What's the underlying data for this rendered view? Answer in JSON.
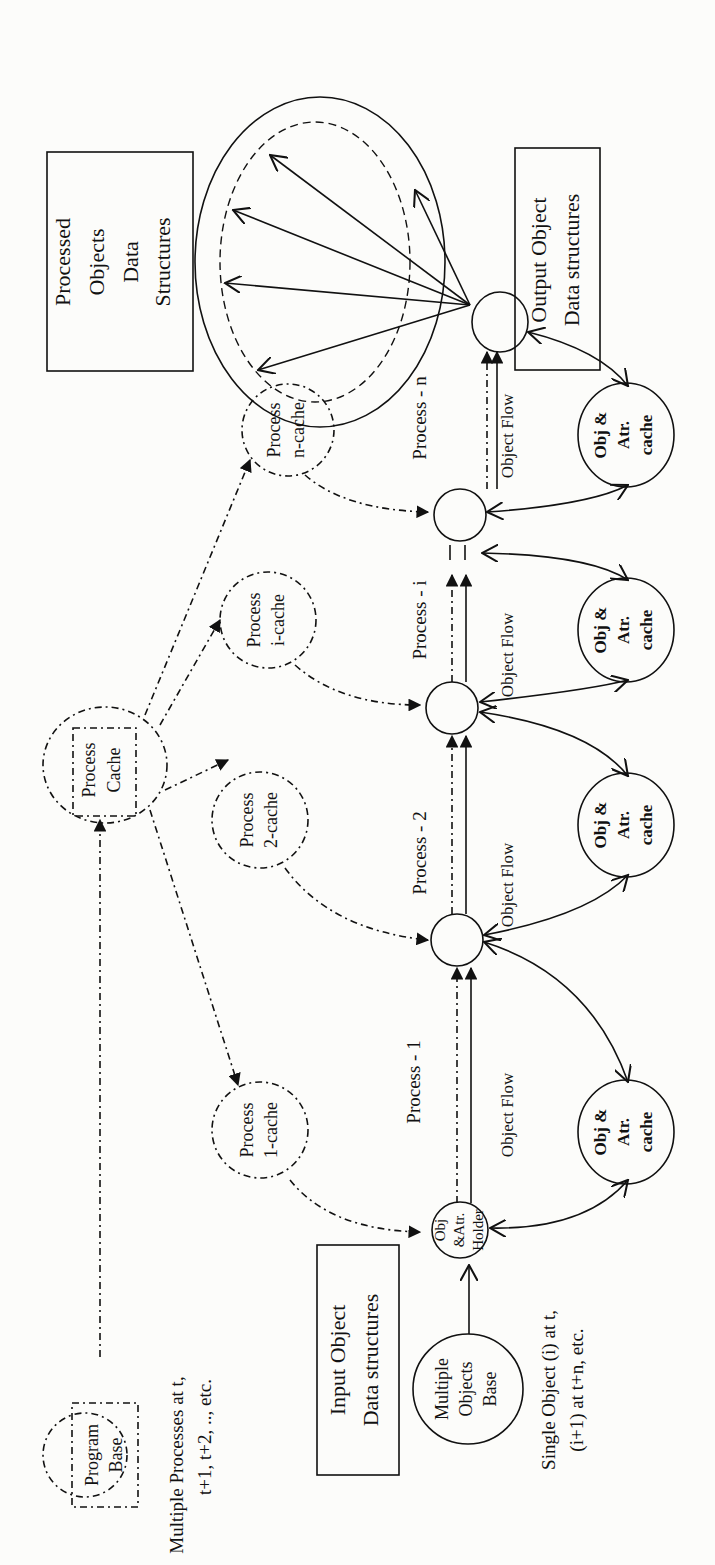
{
  "diagram": {
    "orientation": "rotated 90deg counter-clockwise",
    "boxes": {
      "input": {
        "line1": "Input Object",
        "line2": "Data structures"
      },
      "output": {
        "line1": "Output Object",
        "line2": "Data structures"
      },
      "processed": {
        "line1": "Processed",
        "line2": "Objects",
        "line3": "Data",
        "line4": "Structures"
      }
    },
    "program_base": {
      "line1": "Program",
      "line2": "Base"
    },
    "process_cache": {
      "line1": "Process",
      "line2": "Cache"
    },
    "multiple_processes_note": {
      "line1": "Multiple Processes at t,",
      "line2": "t+1, t+2, .., etc."
    },
    "single_object_note": {
      "line1": "Single Object (i) at t,",
      "line2": "(i+1) at t+n, etc."
    },
    "multiple_objects_base": {
      "line1": "Multiple",
      "line2": "Objects",
      "line3": "Base"
    },
    "holder": {
      "line1": "Obj",
      "line2": "&Atr.",
      "line3": "Holder"
    },
    "process_caches": [
      {
        "line1": "Process",
        "line2": "1-cache"
      },
      {
        "line1": "Process",
        "line2": "2-cache"
      },
      {
        "line1": "Process",
        "line2": "i-cache"
      },
      {
        "line1": "Process",
        "line2": "n-cache"
      }
    ],
    "process_labels": [
      "Process - 1",
      "Process - 2",
      "Process - i",
      "Process - n"
    ],
    "object_flow_label": "Object Flow",
    "obj_caches": [
      {
        "line1": "Obj &",
        "line2": "Atr.",
        "line3": "cache"
      },
      {
        "line1": "Obj &",
        "line2": "Atr.",
        "line3": "cache"
      },
      {
        "line1": "Obj &",
        "line2": "Atr.",
        "line3": "cache"
      },
      {
        "line1": "Obj &",
        "line2": "Atr.",
        "line3": "cache"
      }
    ]
  }
}
